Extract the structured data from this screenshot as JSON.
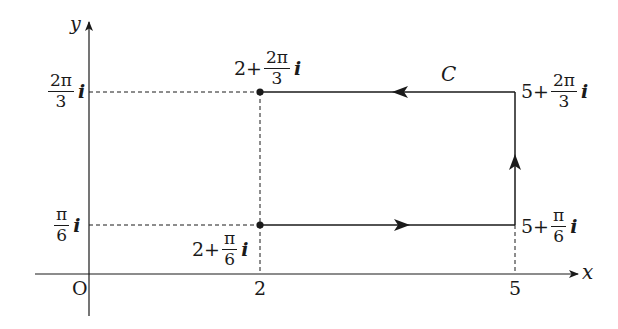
{
  "diagram": {
    "type": "complex-plane contour",
    "axes": {
      "x_label": "x",
      "y_label": "y",
      "origin_label": "O",
      "x_ticks": [
        "2",
        "5"
      ],
      "y_ticks": [
        {
          "num": "2π",
          "den": "3",
          "unit": "i"
        },
        {
          "num": "π",
          "den": "6",
          "unit": "i"
        }
      ]
    },
    "contour": {
      "name": "C",
      "shape": "rectangle",
      "direction": "counterclockwise",
      "vertices": [
        {
          "id": "bottom-left",
          "re": "2",
          "op": "+",
          "num": "π",
          "den": "6",
          "unit": "i",
          "marked": true
        },
        {
          "id": "bottom-right",
          "re": "5",
          "op": "+",
          "num": "π",
          "den": "6",
          "unit": "i",
          "marked": false
        },
        {
          "id": "top-right",
          "re": "5",
          "op": "+",
          "num": "2π",
          "den": "3",
          "unit": "i",
          "marked": false
        },
        {
          "id": "top-left",
          "re": "2",
          "op": "+",
          "num": "2π",
          "den": "3",
          "unit": "i",
          "marked": true
        }
      ]
    },
    "colors": {
      "stroke": "#1a1a1a",
      "background": "#ffffff"
    }
  }
}
